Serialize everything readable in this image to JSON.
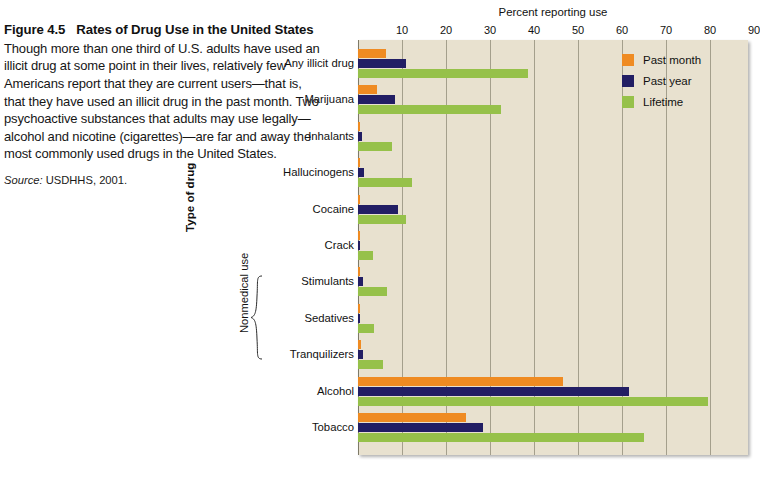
{
  "caption": {
    "figure_number": "Figure 4.5",
    "figure_title": "Rates of Drug Use in the United States",
    "body": "Though more than one third of U.S. adults have used an illicit drug at some point in their lives, relatively few Americans report that they are current users—that is, that they have used an illicit drug in the past month. Two psychoactive substances that adults may use legally—alcohol and nicotine (cigarettes)—are far and away the most commonly used drugs in the United States.",
    "source_word": "Source:",
    "source_text": " USDHHS, 2001."
  },
  "chart_data": {
    "type": "bar",
    "orientation": "horizontal",
    "title": "Percent reporting use",
    "xlabel": "Percent reporting use",
    "ylabel": "Type of drug",
    "xlim": [
      0,
      90
    ],
    "xticks": [
      10,
      20,
      30,
      40,
      50,
      60,
      70,
      80,
      90
    ],
    "grid": true,
    "legend_position": "top-right",
    "categories": [
      "Any illicit drug",
      "Marijuana",
      "Inhalants",
      "Hallucinogens",
      "Cocaine",
      "Crack",
      "Stimulants",
      "Sedatives",
      "Tranquilizers",
      "Alcohol",
      "Tobacco"
    ],
    "group_annotation": {
      "label": "Nonmedical use",
      "covers": [
        "Stimulants",
        "Sedatives",
        "Tranquilizers"
      ]
    },
    "series": [
      {
        "name": "Past month",
        "color": "#ef8b22",
        "values": [
          6.3,
          4.3,
          0.2,
          0.4,
          0.5,
          0.2,
          0.4,
          0.2,
          0.6,
          46.5,
          24.5
        ]
      },
      {
        "name": "Past year",
        "color": "#221e64",
        "values": [
          11.0,
          8.4,
          0.9,
          1.4,
          9.0,
          0.5,
          1.1,
          0.3,
          1.2,
          61.5,
          28.5
        ]
      },
      {
        "name": "Lifetime",
        "color": "#96c14a",
        "values": [
          38.6,
          32.5,
          7.7,
          12.2,
          11.0,
          3.5,
          6.6,
          3.6,
          5.6,
          79.5,
          65.0
        ]
      }
    ]
  },
  "colors": {
    "plot_background": "#e8e1cf",
    "gridline": "#8d8875",
    "past_month": "#ef8b22",
    "past_year": "#221e64",
    "lifetime": "#96c14a"
  }
}
